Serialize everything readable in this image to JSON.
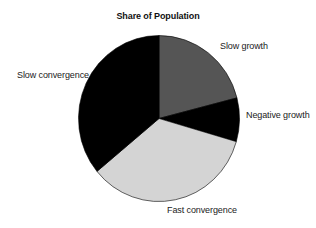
{
  "chart_data": {
    "type": "pie",
    "title": "Share of Population",
    "start_angle_deg": 0,
    "direction": "clockwise",
    "slices": [
      {
        "label": "Slow growth",
        "value": 21,
        "color": "#555555"
      },
      {
        "label": "Negative growth",
        "value": 8.5,
        "color": "#000000"
      },
      {
        "label": "Fast convergence",
        "value": 34.5,
        "color": "#d4d4d4"
      },
      {
        "label": "Slow convergence",
        "value": 36,
        "color": "#000000"
      }
    ],
    "categories": [
      "Slow growth",
      "Negative growth",
      "Fast convergence",
      "Slow convergence"
    ],
    "values": [
      21,
      8.5,
      34.5,
      36
    ],
    "units": "percent of population (estimated)",
    "legend": "none (direct slice labels)"
  },
  "labels": {
    "slow_growth": "Slow growth",
    "negative_growth": "Negative growth",
    "fast_convergence": "Fast convergence",
    "slow_convergence": "Slow convergence"
  }
}
